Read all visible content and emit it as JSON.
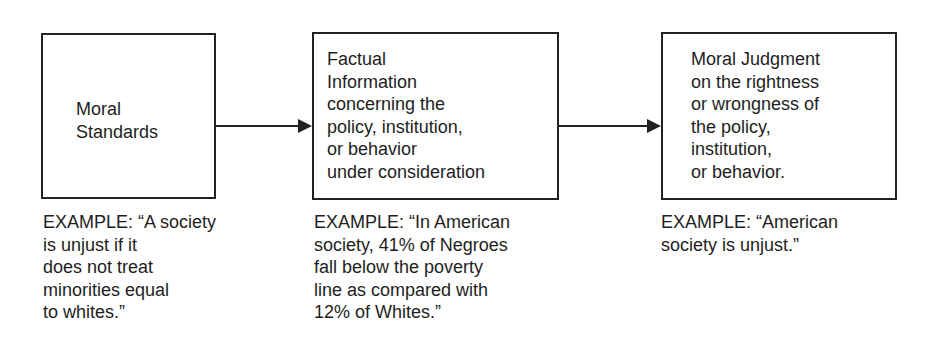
{
  "diagram": {
    "type": "flow",
    "direction": "left-to-right",
    "boxes": [
      {
        "id": "moral-standards",
        "label": "Moral\nStandards"
      },
      {
        "id": "factual-information",
        "label": "Factual\nInformation\nconcerning the\npolicy, institution,\nor behavior\nunder consideration"
      },
      {
        "id": "moral-judgment",
        "label": "Moral Judgment\non the rightness\nor wrongness of\nthe policy,\ninstitution,\nor behavior."
      }
    ],
    "arrows": [
      {
        "from": "moral-standards",
        "to": "factual-information"
      },
      {
        "from": "factual-information",
        "to": "moral-judgment"
      }
    ],
    "examples": [
      "EXAMPLE:  “A society\nis unjust if it\ndoes not treat\nminorities equal\nto whites.”",
      "EXAMPLE:  “In American\nsociety, 41% of Negroes\nfall below the poverty\nline as compared with\n12% of Whites.”",
      "EXAMPLE:  “American\nsociety is unjust.”"
    ],
    "colors": {
      "stroke": "#222222",
      "text": "#1e1e1e",
      "background": "#ffffff"
    }
  }
}
